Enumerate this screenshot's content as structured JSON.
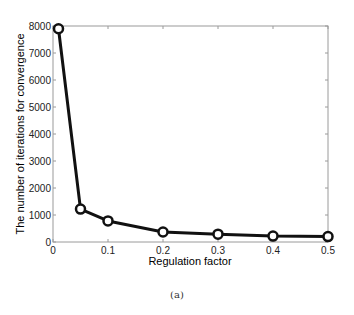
{
  "caption": "(a)",
  "chart_data": {
    "type": "line",
    "title": "",
    "xlabel": "Regulation factor",
    "ylabel": "The number of iterations for convergence",
    "xlim": [
      0,
      0.5
    ],
    "ylim": [
      0,
      8000
    ],
    "xticks": [
      0,
      0.1,
      0.2,
      0.3,
      0.4,
      0.5
    ],
    "xtick_labels": [
      "0",
      "0.1",
      "0.2",
      "0.3",
      "0.4",
      "0.5"
    ],
    "yticks": [
      0,
      1000,
      2000,
      3000,
      4000,
      5000,
      6000,
      7000,
      8000
    ],
    "ytick_labels": [
      "0",
      "1000",
      "2000",
      "3000",
      "4000",
      "5000",
      "6000",
      "7000",
      "8000"
    ],
    "grid": false,
    "legend": null,
    "series": [
      {
        "name": "iterations",
        "marker": "circle",
        "color": "#111111",
        "x": [
          0.01,
          0.05,
          0.1,
          0.2,
          0.3,
          0.4,
          0.5
        ],
        "values": [
          7900,
          1220,
          780,
          370,
          290,
          220,
          200
        ]
      }
    ]
  }
}
